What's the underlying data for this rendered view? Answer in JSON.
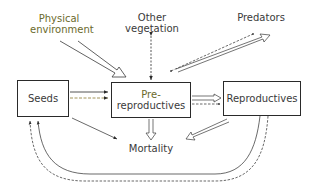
{
  "diagram": {
    "type": "flow",
    "nodes": {
      "seeds": "Seeds",
      "pre_reproductives_line1": "Pre-",
      "pre_reproductives_line2": "reproductives",
      "reproductives": "Reproductives",
      "mortality": "Mortality"
    },
    "factors": {
      "physical_environment_line1": "Physical",
      "physical_environment_line2": "environment",
      "other_vegetation_line1": "Other",
      "other_vegetation_line2": "vegetation",
      "predators": "Predators"
    },
    "edges": [
      {
        "from": "Physical environment",
        "to": "Pre-reproductives",
        "style": "hollow-arrow"
      },
      {
        "from": "Other vegetation",
        "to": "Pre-reproductives",
        "style": "dashed-double-headed"
      },
      {
        "from": "Predators",
        "to": "Pre-reproductives",
        "style": "hollow-arrow and dashed-double-headed"
      },
      {
        "from": "Seeds",
        "to": "Pre-reproductives",
        "style": "solid and dashed"
      },
      {
        "from": "Seeds",
        "to": "Mortality",
        "style": "solid"
      },
      {
        "from": "Pre-reproductives",
        "to": "Reproductives",
        "style": "hollow-arrow and dashed"
      },
      {
        "from": "Pre-reproductives",
        "to": "Mortality",
        "style": "hollow-arrow"
      },
      {
        "from": "Reproductives",
        "to": "Mortality",
        "style": "hollow-arrow"
      },
      {
        "from": "Reproductives",
        "to": "Seeds",
        "style": "solid and dashed loop"
      }
    ],
    "colors": {
      "line": "#2a2a2a",
      "text": "#3a3a3a",
      "accent_text": "#6b6a2c",
      "dashed_accent": "#8a7a30"
    }
  }
}
